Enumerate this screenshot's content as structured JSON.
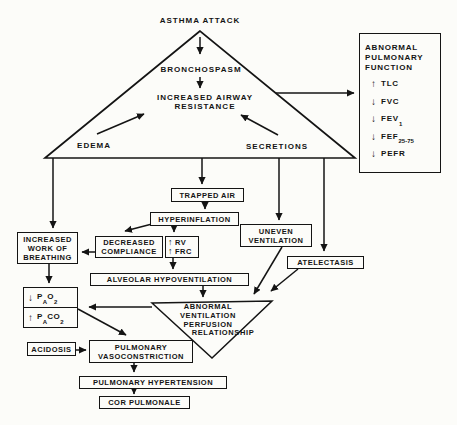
{
  "colors": {
    "ink": "#141414",
    "paper": "#fcfcf9"
  },
  "icons": {
    "up_arrow": "↑",
    "down_arrow": "↓"
  },
  "nodes": {
    "asthma_attack": "ASTHMA ATTACK",
    "bronchospasm": "BRONCHOSPASM",
    "increased_airway_resistance": [
      "INCREASED AIRWAY",
      "RESISTANCE"
    ],
    "edema": "EDEMA",
    "secretions": "SECRETIONS",
    "trapped_air": "TRAPPED AIR",
    "hyperinflation": "HYPERINFLATION",
    "uneven_ventilation": [
      "UNEVEN",
      "VENTILATION"
    ],
    "decreased_compliance": [
      "DECREASED",
      "COMPLIANCE"
    ],
    "rv_frc": [
      {
        "arrow": "↑",
        "label": "RV"
      },
      {
        "arrow": "↑",
        "label": "FRC"
      }
    ],
    "increased_work_of_breathing": [
      "INCREASED",
      "WORK OF",
      "BREATHING"
    ],
    "atelectasis": "ATELECTASIS",
    "alveolar_hypoventilation": "ALVEOLAR HYPOVENTILATION",
    "blood_gas": {
      "pao2": {
        "arrow": "↓",
        "p": "P",
        "p_sub": "A",
        "gas": "O",
        "gas_sub": "2"
      },
      "paco2": {
        "arrow": "↑",
        "p": "P",
        "p_sub": "A",
        "gas": "CO",
        "gas_sub": "2"
      }
    },
    "vq_relationship": [
      "ABNORMAL",
      "VENTILATION",
      "PERFUSION",
      "RELATIONSHIP"
    ],
    "acidosis": "ACIDOSIS",
    "pulmonary_vasoconstriction": [
      "PULMONARY",
      "VASOCONSTRICTION"
    ],
    "pulmonary_hypertension": "PULMONARY HYPERTENSION",
    "cor_pulmonale": "COR PULMONALE"
  },
  "pulmonary_function_box": {
    "title": [
      "ABNORMAL",
      "PULMONARY",
      "FUNCTION"
    ],
    "items": [
      {
        "arrow": "↑",
        "label": "TLC",
        "sub": ""
      },
      {
        "arrow": "↓",
        "label": "FVC",
        "sub": ""
      },
      {
        "arrow": "↓",
        "label": "FEV",
        "sub": "1"
      },
      {
        "arrow": "↓",
        "label": "FEF",
        "sub": "25-75"
      },
      {
        "arrow": "↓",
        "label": "PEFR",
        "sub": ""
      }
    ]
  }
}
